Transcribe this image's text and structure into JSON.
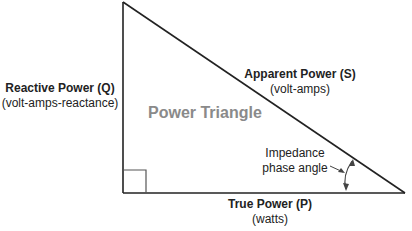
{
  "diagram": {
    "title": "Power Triangle",
    "reactive": {
      "label": "Reactive Power (Q)",
      "unit": "(volt-amps-reactance)"
    },
    "apparent": {
      "label": "Apparent Power (S)",
      "unit": "(volt-amps)"
    },
    "true_power": {
      "label": "True Power (P)",
      "unit": "(watts)"
    },
    "angle": {
      "line1": "Impedance",
      "line2": "phase angle"
    },
    "colors": {
      "lines": "#222222",
      "title": "#8a8a8a"
    }
  }
}
